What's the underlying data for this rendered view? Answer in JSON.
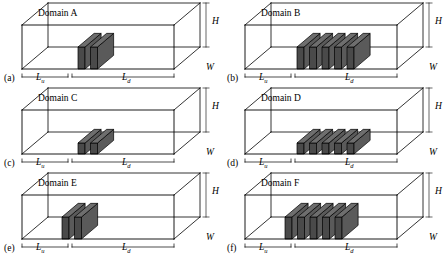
{
  "figure": {
    "caption_letters": [
      "(a)",
      "(b)",
      "(c)",
      "(d)",
      "(e)",
      "(f)"
    ],
    "dimension_labels": {
      "height": "H",
      "width": "W",
      "upstream": "L",
      "upstream_sub": "u",
      "downstream": "L",
      "downstream_sub": "d"
    },
    "colors": {
      "outline": "#000000",
      "block_top": "#6e6e6e",
      "block_front": "#4a4a4a",
      "block_side": "#5a5a5a",
      "background": "#ffffff"
    }
  },
  "panels": [
    {
      "id": "a",
      "letter": "(a)",
      "title": "Domain A",
      "blocks": {
        "count": 2,
        "height": "tall",
        "position": "center"
      }
    },
    {
      "id": "b",
      "letter": "(b)",
      "title": "Domain B",
      "blocks": {
        "count": 5,
        "height": "tall",
        "position": "center"
      }
    },
    {
      "id": "c",
      "letter": "(c)",
      "title": "Domain C",
      "blocks": {
        "count": 2,
        "height": "short",
        "position": "center"
      }
    },
    {
      "id": "d",
      "letter": "(d)",
      "title": "Domain D",
      "blocks": {
        "count": 5,
        "height": "short",
        "position": "center"
      }
    },
    {
      "id": "e",
      "letter": "(e)",
      "title": "Domain E",
      "blocks": {
        "count": 2,
        "height": "tall",
        "position": "left"
      }
    },
    {
      "id": "f",
      "letter": "(f)",
      "title": "Domain F",
      "blocks": {
        "count": 5,
        "height": "tall",
        "position": "left"
      }
    }
  ]
}
